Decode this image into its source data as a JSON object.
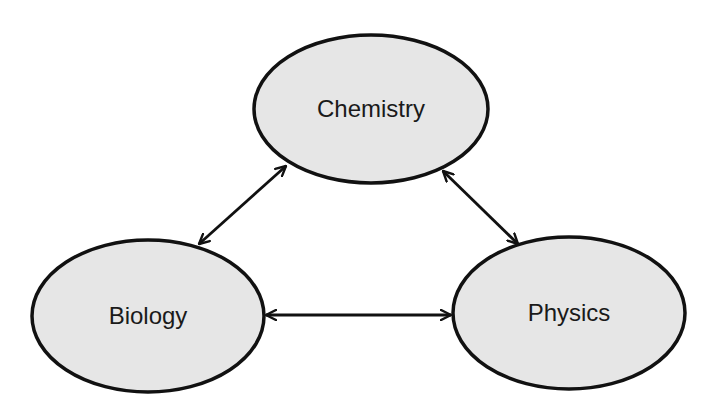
{
  "diagram": {
    "type": "concept-map",
    "colors": {
      "node_fill": "#e6e6e6",
      "stroke": "#111111",
      "text": "#1a1a1a",
      "background": "#ffffff"
    },
    "nodes": [
      {
        "id": "chemistry",
        "label": "Chemistry",
        "cx": 371,
        "cy": 109,
        "rx": 117,
        "ry": 74
      },
      {
        "id": "biology",
        "label": "Biology",
        "cx": 148,
        "cy": 316,
        "rx": 116,
        "ry": 76
      },
      {
        "id": "physics",
        "label": "Physics",
        "cx": 569,
        "cy": 313,
        "rx": 116,
        "ry": 76
      }
    ],
    "edges": [
      {
        "from": "biology",
        "to": "chemistry",
        "bidirectional": true,
        "x1": 199,
        "y1": 244,
        "x2": 286,
        "y2": 166
      },
      {
        "from": "chemistry",
        "to": "physics",
        "bidirectional": true,
        "x1": 443,
        "y1": 171,
        "x2": 518,
        "y2": 244
      },
      {
        "from": "biology",
        "to": "physics",
        "bidirectional": true,
        "x1": 266,
        "y1": 315,
        "x2": 451,
        "y2": 315
      }
    ]
  }
}
